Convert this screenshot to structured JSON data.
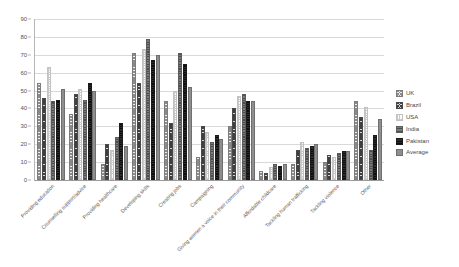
{
  "chart_data": {
    "type": "bar",
    "title": "",
    "xlabel": "",
    "ylabel": "",
    "ylim": [
      0,
      90
    ],
    "yticks": [
      0,
      10,
      20,
      30,
      40,
      50,
      60,
      70,
      80,
      90
    ],
    "grid": true,
    "legend_position": "right",
    "categories": [
      "Providing education",
      "Counselling support/advice",
      "Providing healthcare",
      "Developing skills",
      "Creating jobs",
      "Campaigning",
      "Giving women a voice in their community",
      "Affordable childcare",
      "Tackling human trafficking",
      "Tackling violence",
      "Other"
    ],
    "series": [
      {
        "name": "UK",
        "color": "#efefef",
        "values": [
          54,
          37,
          9,
          71,
          44,
          13,
          30,
          5,
          9,
          10,
          44
        ]
      },
      {
        "name": "Brazil",
        "color": "#d5d5d5",
        "values": [
          46,
          48,
          20,
          54,
          32,
          30,
          40,
          4,
          17,
          14,
          35
        ]
      },
      {
        "name": "USA",
        "color": "#fbfbfb",
        "values": [
          63,
          51,
          17,
          73,
          50,
          27,
          47,
          7,
          21,
          13,
          41
        ]
      },
      {
        "name": "India",
        "color": "#7c7c7c",
        "values": [
          44,
          45,
          24,
          79,
          71,
          21,
          48,
          9,
          18,
          15,
          17
        ]
      },
      {
        "name": "Pakistan",
        "color": "#2e2e2e",
        "values": [
          45,
          54,
          32,
          67,
          65,
          25,
          44,
          8,
          19,
          16,
          25
        ]
      },
      {
        "name": "Average",
        "color": "#8e8e8e",
        "values": [
          51,
          50,
          19,
          70,
          52,
          23,
          44,
          9,
          20,
          16,
          34
        ]
      }
    ]
  },
  "legend": {
    "items": [
      {
        "label": "UK"
      },
      {
        "label": "Brazil"
      },
      {
        "label": "USA"
      },
      {
        "label": "India"
      },
      {
        "label": "Pakistan"
      },
      {
        "label": "Average"
      }
    ]
  }
}
